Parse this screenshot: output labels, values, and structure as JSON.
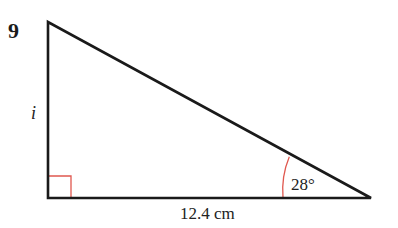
{
  "question_number": "9",
  "triangle": {
    "vertices": {
      "top": [
        48,
        22
      ],
      "right_angle": [
        48,
        198
      ],
      "acute": [
        371,
        198
      ]
    },
    "side_label_vertical": "i",
    "side_label_base": "12.4 cm",
    "angle_label": "28°",
    "right_angle_marker": true
  },
  "colors": {
    "lines": "#1a1a1a",
    "markers": "#e0584f",
    "text": "#222222"
  }
}
